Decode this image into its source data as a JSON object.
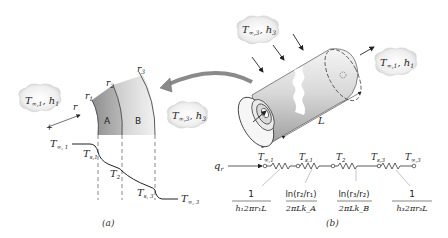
{
  "figure": {
    "panel_a": {
      "caption": "(a)",
      "ambient_inner": {
        "T": "T",
        "T_sub": "∞,1",
        "h": "h",
        "h_sub": "1"
      },
      "ambient_outer": {
        "T": "T",
        "T_sub": "∞,3",
        "h": "h",
        "h_sub": "3"
      },
      "radii": [
        {
          "label": "r",
          "sub": "1"
        },
        {
          "label": "r",
          "sub": "2"
        },
        {
          "label": "r",
          "sub": "3"
        }
      ],
      "radius_axis": "r",
      "layers": [
        {
          "label": "A"
        },
        {
          "label": "B"
        }
      ],
      "temperature_profile": [
        {
          "label": "T",
          "sub": "∞, 1"
        },
        {
          "label": "T",
          "sub": "s,1"
        },
        {
          "label": "T",
          "sub": "2"
        },
        {
          "label": "T",
          "sub": "s, 3"
        },
        {
          "label": "T",
          "sub": "∞, 3"
        }
      ]
    },
    "panel_b": {
      "caption": "(b)",
      "ambient_outer": {
        "T": "T",
        "T_sub": "∞,3",
        "h": "h",
        "h_sub": "3"
      },
      "ambient_inner": {
        "T": "T",
        "T_sub": "∞,1",
        "h": "h",
        "h_sub": "1"
      },
      "length_label": "L",
      "heat_rate": {
        "label": "q",
        "sub": "r"
      },
      "nodes": [
        {
          "label": "T",
          "sub": "∞,1"
        },
        {
          "label": "T",
          "sub": "s,1"
        },
        {
          "label": "T",
          "sub": "2"
        },
        {
          "label": "T",
          "sub": "s,3"
        },
        {
          "label": "T",
          "sub": "∞,3"
        }
      ],
      "resistances": [
        {
          "numerator": "1",
          "denominator": "h₁2πr₁L"
        },
        {
          "numerator": "ln(r₂/r₁)",
          "denominator": "2πLk_A"
        },
        {
          "numerator": "ln(r₃/r₂)",
          "denominator": "2πLk_B"
        },
        {
          "numerator": "1",
          "denominator": "h₃2πr₃L"
        }
      ]
    }
  }
}
